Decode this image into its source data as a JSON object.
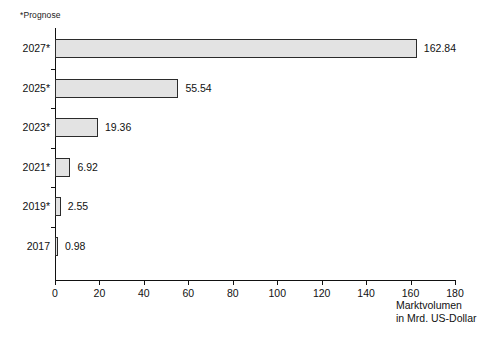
{
  "footnote": "*Prognose",
  "axis_title": {
    "line1": "Marktvolumen",
    "line2": "in Mrd. US-Dollar"
  },
  "chart_data": {
    "type": "bar",
    "orientation": "horizontal",
    "title": "",
    "subtitle": "",
    "xlabel": "Marktvolumen in Mrd. US-Dollar",
    "ylabel": "",
    "xlim": [
      0,
      180
    ],
    "xticks": [
      0,
      20,
      40,
      60,
      80,
      100,
      120,
      140,
      160,
      180
    ],
    "xtick_labels": [
      "0",
      "20",
      "40",
      "60",
      "80",
      "100",
      "120",
      "140",
      "160",
      "180"
    ],
    "grid": false,
    "legend": null,
    "annotations": [
      "*Prognose"
    ],
    "categories": [
      "2027*",
      "2025*",
      "2023*",
      "2021*",
      "2019*",
      "2017"
    ],
    "values": [
      162.84,
      55.54,
      19.36,
      6.92,
      2.55,
      0.98
    ],
    "value_labels": [
      "162.84",
      "55.54",
      "19.36",
      "6.92",
      "2.55",
      "0.98"
    ],
    "bar_fill": "#e3e3e3",
    "bar_stroke": "#2b2b2b",
    "axis_color": "#111111"
  }
}
